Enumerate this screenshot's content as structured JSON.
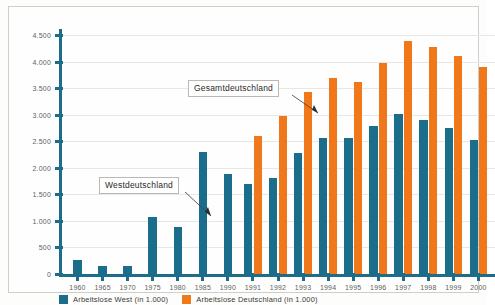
{
  "chart_data": {
    "type": "bar",
    "title": "",
    "xlabel": "",
    "ylabel": "",
    "ylim": [
      0,
      4500
    ],
    "ytick_step": 500,
    "grid": true,
    "legend_position": "bottom-left",
    "categories": [
      "1960",
      "1965",
      "1970",
      "1975",
      "1980",
      "1985",
      "1990",
      "1991",
      "1992",
      "1993",
      "1994",
      "1995",
      "1996",
      "1997",
      "1998",
      "1999",
      "2000"
    ],
    "ytick_labels": [
      "0",
      "500",
      "1.000",
      "1.500",
      "2.000",
      "2.500",
      "3.000",
      "3.500",
      "4.000",
      "4.500"
    ],
    "ytick_values": [
      0,
      500,
      1000,
      1500,
      2000,
      2500,
      3000,
      3500,
      4000,
      4500
    ],
    "series": [
      {
        "name": "Arbeitslose West (in 1.000)",
        "color": "#1a6d8b",
        "values": [
          271,
          147,
          149,
          1074,
          889,
          2304,
          1883,
          1689,
          1808,
          2270,
          2556,
          2565,
          2796,
          3021,
          2904,
          2756,
          2529
        ]
      },
      {
        "name": "Arbeitslose Deutschland (in 1.000)",
        "color": "#f0781a",
        "values": [
          null,
          null,
          null,
          null,
          null,
          null,
          null,
          2602,
          2979,
          3419,
          3698,
          3612,
          3965,
          4384,
          4281,
          4101,
          3889
        ]
      }
    ],
    "annotations": [
      {
        "label": "Westdeutschland",
        "target_category": "1985"
      },
      {
        "label": "Gesamtdeutschland",
        "target_category": "1991"
      }
    ]
  },
  "legend": {
    "items": [
      {
        "label": "Arbeitslose West  (in 1.000)",
        "color": "#1a6d8b"
      },
      {
        "label": "Arbeitslose Deutschland  (in 1.000)",
        "color": "#f0781a"
      }
    ]
  },
  "colors": {
    "west": "#1a6d8b",
    "germany": "#f0781a",
    "axis": "#1d6c8a",
    "grid": "#e7e7e4",
    "background": "#fefefe"
  }
}
